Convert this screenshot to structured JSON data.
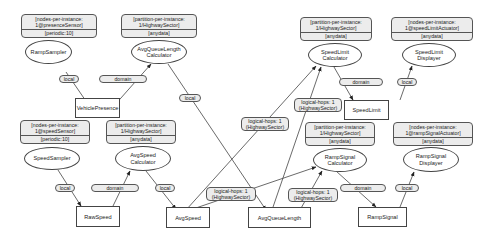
{
  "annotations": {
    "ramp_sampler": {
      "line1": "[nodes-per-instance:",
      "line2": "1@presenceSensor]",
      "bottom": "[periodic:10]"
    },
    "avg_queue_length_calculator": {
      "line1": "[partition-per-instance:",
      "line2": "1/HighwaySector]",
      "bottom": "[anydata]"
    },
    "speed_limit_calculator": {
      "line1": "[partition-per-instance:",
      "line2": "1/HighwaySector]",
      "bottom": "[anydata]"
    },
    "speed_limit_displayer": {
      "line1": "[nodes-per-instance:",
      "line2": "1@speedLimitActuator]",
      "bottom": "[anydata]"
    },
    "speed_sampler": {
      "line1": "[nodes-per-instance:",
      "line2": "1@speedSensor]",
      "bottom": "[periodic:10]"
    },
    "avg_speed_calculator": {
      "line1": "[partition-per-instance:",
      "line2": "1/HighwaySector]",
      "bottom": "[anydata]"
    },
    "ramp_signal_calculator": {
      "line1": "[partition-per-instance:",
      "line2": "1/HighwaySector]",
      "bottom": "[anydata]"
    },
    "ramp_signal_displayer": {
      "line1": "[nodes-per-instance:",
      "line2": "1@rampSignalActuator]",
      "bottom": "[anydata]"
    }
  },
  "operators": {
    "ramp_sampler": "RampSampler",
    "avg_queue_length_calculator": "AvgQueueLength\nCalculator",
    "speed_limit_calculator": "SpeedLimit\nCalculator",
    "speed_limit_displayer": "SpeedLimit\nDisplayer",
    "speed_sampler": "SpeedSampler",
    "avg_speed_calculator": "AvgSpeed\nCalculator",
    "ramp_signal_calculator": "RampSignal\nCalculator",
    "ramp_signal_displayer": "RampSignal\nDisplayer"
  },
  "data_items": {
    "vehicle_presence": "VehiclePresence",
    "speed_limit": "SpeedLimit",
    "raw_speed": "RawSpeed",
    "avg_speed": "AvgSpeed",
    "avg_queue_length": "AvgQueueLength",
    "ramp_signal": "RampSignal"
  },
  "edge_labels": {
    "local_ramp_vehicle": "local",
    "domain_vehicle_avgqueue": "domain",
    "local_avgqueue_length": "local",
    "logical_avgspeed_speedlimit_1": "logical-hops: 1",
    "logical_avgspeed_speedlimit_2": "(HighwaySector)",
    "logical_avgqueue_speedlimit_1": "logical-hops: 1",
    "logical_avgqueue_speedlimit_2": "(HighwaySector)",
    "domain_speedlimit": "domain",
    "local_speedlimit_displayer": "local",
    "local_speed_raw": "local",
    "domain_raw_avgspeed": "domain",
    "local_avgspeed": "local",
    "logical_avgspeed_ramp_1": "logical-hops: 1",
    "logical_avgspeed_ramp_2": "(HighwaySector)",
    "logical_avgqueue_ramp_1": "logical-hops: 1",
    "logical_avgqueue_ramp_2": "(HighwaySector)",
    "domain_rampsignal": "domain",
    "local_rampsignal_displayer": "local"
  }
}
